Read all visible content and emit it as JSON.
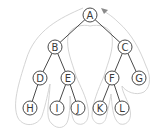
{
  "diagram": {
    "type": "binary-tree-euler-tour",
    "nodes": [
      {
        "id": "A",
        "label": "A",
        "x": 90,
        "y": 15
      },
      {
        "id": "B",
        "label": "B",
        "x": 55,
        "y": 47
      },
      {
        "id": "C",
        "label": "C",
        "x": 125,
        "y": 47
      },
      {
        "id": "D",
        "label": "D",
        "x": 40,
        "y": 78
      },
      {
        "id": "E",
        "label": "E",
        "x": 68,
        "y": 78
      },
      {
        "id": "F",
        "label": "F",
        "x": 112,
        "y": 78
      },
      {
        "id": "G",
        "label": "G",
        "x": 139,
        "y": 78
      },
      {
        "id": "H",
        "label": "H",
        "x": 30,
        "y": 108
      },
      {
        "id": "I",
        "label": "I",
        "x": 57,
        "y": 108
      },
      {
        "id": "J",
        "label": "J",
        "x": 78,
        "y": 108
      },
      {
        "id": "K",
        "label": "K",
        "x": 100,
        "y": 108
      },
      {
        "id": "L",
        "label": "L",
        "x": 122,
        "y": 108
      }
    ],
    "edges": [
      [
        "A",
        "B"
      ],
      [
        "A",
        "C"
      ],
      [
        "B",
        "D"
      ],
      [
        "B",
        "E"
      ],
      [
        "D",
        "H"
      ],
      [
        "E",
        "I"
      ],
      [
        "E",
        "J"
      ],
      [
        "C",
        "F"
      ],
      [
        "C",
        "G"
      ],
      [
        "F",
        "K"
      ],
      [
        "F",
        "L"
      ]
    ],
    "contour": {
      "description": "Euler tour path around the tree, starting left of A and ending with an arrow at the upper right of A",
      "color": "#cfcfcf",
      "arrow_color": "#8a8a8a"
    },
    "colors": {
      "node_stroke": "#4a4a4a",
      "node_fill": "#ffffff",
      "label": "#3a3a3a",
      "background": "#ffffff"
    }
  }
}
